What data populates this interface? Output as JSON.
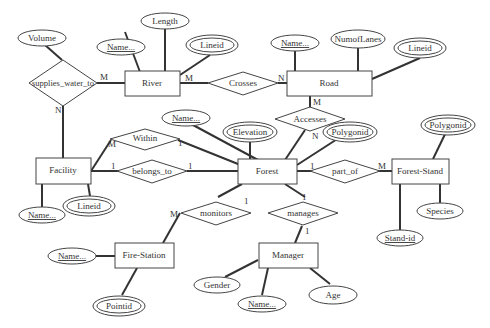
{
  "entities": {
    "river": "River",
    "road": "Road",
    "facility": "Facility",
    "forest": "Forest",
    "forest_stand": "Forest-Stand",
    "fire_station": "Fire-Station",
    "manager": "Manager"
  },
  "relationships": {
    "supplies_water_to": "supplies_water_to",
    "crosses": "Crosses",
    "accesses": "Accesses",
    "within": "Within",
    "belongs_to": "belongs_to",
    "part_of": "part_of",
    "monitors": "monitors",
    "manages": "manages"
  },
  "attributes": {
    "volume": "Volume",
    "length": "Length",
    "river_name": "Name...",
    "river_lineid": "Lineid",
    "road_name": "Name...",
    "numoflanes": "NumofLanes",
    "road_lineid": "Lineid",
    "forest_name": "Name...",
    "elevation": "Elevation",
    "forest_polygonid": "Polygonid",
    "stand_polygonid": "Polygonid",
    "species": "Species",
    "stand_id": "Stand-id",
    "facility_name": "Name...",
    "facility_lineid": "Lineid",
    "fs_name": "Name...",
    "pointid": "Pointid",
    "gender": "Gender",
    "manager_name": "Name...",
    "age": "Age"
  },
  "cardinalities": {
    "sw_river": "M",
    "sw_facility": "N",
    "cr_river": "M",
    "cr_road": "N",
    "ac_road": "M",
    "ac_forest": "N",
    "wi_facility": "M",
    "wi_forest": "1",
    "bt_facility": "1",
    "bt_forest": "1",
    "po_forest": "1",
    "po_stand": "M",
    "mo_fs": "M",
    "mo_forest": "1",
    "ma_forest": "1",
    "ma_manager": "1"
  }
}
